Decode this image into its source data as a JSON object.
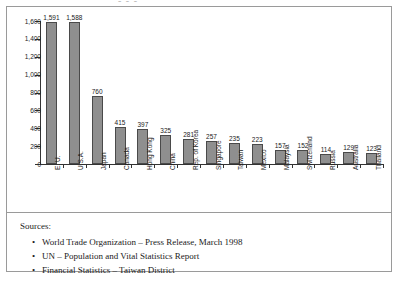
{
  "ghost_text": "-  -  -",
  "chart_data": {
    "type": "bar",
    "title": "",
    "xlabel": "",
    "ylabel": "",
    "ylim": [
      0,
      1600
    ],
    "ytick_labels": [
      "1,600",
      "1,400",
      "1,200",
      "1,000",
      "800",
      "600",
      "400",
      "200",
      "0"
    ],
    "ytick_values": [
      1600,
      1400,
      1200,
      1000,
      800,
      600,
      400,
      200,
      0
    ],
    "grid": false,
    "legend": "none",
    "categories": [
      "E. U.",
      "U.S.A.",
      "Japan",
      "Canada",
      "Hong Kong",
      "China",
      "Rep. of Korea",
      "Singapore",
      "Taiwan",
      "Mexico",
      "Malaysia",
      "Switzerland",
      "Russia",
      "Australia",
      "Thailand"
    ],
    "values": [
      1591,
      1588,
      760,
      415,
      397,
      325,
      281,
      257,
      235,
      223,
      157,
      152,
      114,
      129,
      123
    ],
    "value_labels": [
      "1,591",
      "1,588",
      "760",
      "415",
      "397",
      "325",
      "281",
      "257",
      "235",
      "223",
      "157",
      "152",
      "114",
      "129",
      "123"
    ],
    "bar_color": "#8f8f8f",
    "bar_border_color": "#4a4a4a",
    "axis_color": "#333333"
  },
  "sources": {
    "heading": "Sources:",
    "bullet": "•",
    "items": [
      "World Trade Organization – Press Release, March 1998",
      "UN – Population and Vital Statistics Report",
      "Financial Statistics – Taiwan District"
    ]
  }
}
